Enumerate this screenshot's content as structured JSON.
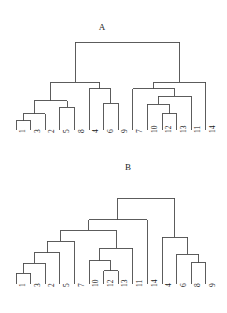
{
  "figure": {
    "width": 227,
    "height": 313,
    "background_color": "#ffffff",
    "line_color": "#4a4a4a",
    "text_color": "#202020"
  },
  "panels": [
    {
      "id": "A",
      "title": "A",
      "title_x": 92,
      "title_y": 22,
      "axis_baseline_y": 130,
      "root_y": 42,
      "leaf_spacing": 14.6,
      "leaf_start_x": 16
    },
    {
      "id": "B",
      "title": "B",
      "title_x": 118,
      "title_y": 6,
      "axis_baseline_y": 128,
      "root_y": 42,
      "leaf_spacing": 14.6,
      "leaf_start_x": 16
    }
  ],
  "chart_data": [
    {
      "type": "dendrogram",
      "panel": "A",
      "title": "A",
      "xlabel": "",
      "ylabel": "",
      "grid": false,
      "legend": "none",
      "leaf_labels": [
        "1",
        "3",
        "2",
        "5",
        "8",
        "4",
        "6",
        "9",
        "7",
        "10",
        "12",
        "13",
        "11",
        "14"
      ],
      "leaf_count": 14,
      "merges": [
        {
          "id": "m1",
          "left": "1",
          "right": "3",
          "height": 10
        },
        {
          "id": "m2",
          "left": "m1",
          "right": "2",
          "height": 18
        },
        {
          "id": "m3",
          "left": "5",
          "right": "8",
          "height": 25
        },
        {
          "id": "m4",
          "left": "m2",
          "right": "m3",
          "height": 32
        },
        {
          "id": "m5",
          "left": "6",
          "right": "9",
          "height": 29
        },
        {
          "id": "m6",
          "left": "4",
          "right": "m5",
          "height": 45
        },
        {
          "id": "m7",
          "left": "m4",
          "right": "m6",
          "height": 52
        },
        {
          "id": "m8",
          "left": "12",
          "right": "13",
          "height": 18
        },
        {
          "id": "m9",
          "left": "10",
          "right": "m8",
          "height": 28
        },
        {
          "id": "m10",
          "left": "m9",
          "right": "11",
          "height": 37
        },
        {
          "id": "m11",
          "left": "7",
          "right": "m10",
          "height": 45
        },
        {
          "id": "m12",
          "left": "m11",
          "right": "14",
          "height": 52
        },
        {
          "id": "root",
          "left": "m7",
          "right": "m12",
          "height": 96
        }
      ]
    },
    {
      "type": "dendrogram",
      "panel": "B",
      "title": "B",
      "xlabel": "",
      "ylabel": "",
      "grid": false,
      "legend": "none",
      "leaf_labels": [
        "1",
        "3",
        "2",
        "5",
        "7",
        "10",
        "12",
        "13",
        "11",
        "14",
        "4",
        "6",
        "8",
        "9"
      ],
      "leaf_count": 14,
      "merges": [
        {
          "id": "n1",
          "left": "1",
          "right": "3",
          "height": 12
        },
        {
          "id": "n2",
          "left": "n1",
          "right": "2",
          "height": 23
        },
        {
          "id": "n3",
          "left": "n2",
          "right": "5",
          "height": 35
        },
        {
          "id": "n4",
          "left": "n3",
          "right": "7",
          "height": 48
        },
        {
          "id": "n5",
          "left": "12",
          "right": "13",
          "height": 15
        },
        {
          "id": "n6",
          "left": "10",
          "right": "n5",
          "height": 26
        },
        {
          "id": "n7",
          "left": "n6",
          "right": "11",
          "height": 40
        },
        {
          "id": "n8",
          "left": "n4",
          "right": "n7",
          "height": 60
        },
        {
          "id": "n9",
          "left": "n8",
          "right": "14",
          "height": 72
        },
        {
          "id": "n10",
          "left": "8",
          "right": "9",
          "height": 24
        },
        {
          "id": "n11",
          "left": "6",
          "right": "n10",
          "height": 33
        },
        {
          "id": "n12",
          "left": "4",
          "right": "n11",
          "height": 52
        },
        {
          "id": "root",
          "left": "n9",
          "right": "n12",
          "height": 96
        }
      ]
    }
  ]
}
